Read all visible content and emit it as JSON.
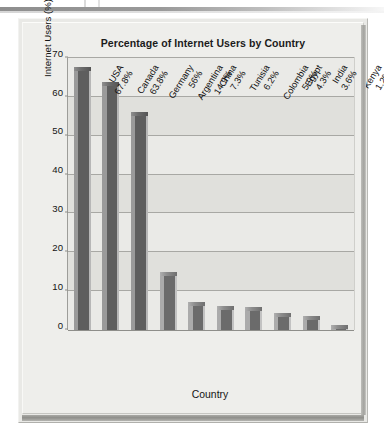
{
  "page": {
    "background_color": "#ffffff",
    "card_background": "#eeeeeb"
  },
  "chart_data": {
    "type": "bar",
    "title": "Percentage of Internet Users by Country",
    "xlabel": "Country",
    "ylabel": "Internet Users (%)",
    "ylim": [
      0,
      70
    ],
    "ytick_step": 10,
    "yticks": [
      0,
      10,
      20,
      30,
      40,
      50,
      60,
      70
    ],
    "grid": true,
    "legend": "none",
    "bar_color": "#5e5e5e",
    "bar_highlight_color": "#9a9a9a",
    "bar_shadow_color": "#b7b7b7",
    "categories": [
      "USA",
      "Canada",
      "Germany",
      "Argentina",
      "China",
      "Tunisia",
      "Colombia",
      "Egypt",
      "India",
      "Kenya"
    ],
    "values": [
      67.8,
      63.8,
      56,
      14.9,
      7.3,
      6.2,
      5.9,
      4.3,
      3.6,
      1.2
    ],
    "value_labels": [
      "67.8%",
      "63.8%",
      "56%",
      "14.9%",
      "7.3%",
      "6.2%",
      "5.9%",
      "4.3%",
      "3.6%",
      "1.2%"
    ],
    "tick_labels": [
      {
        "country": "USA",
        "pct": "67.8%"
      },
      {
        "country": "Canada",
        "pct": "63.8%"
      },
      {
        "country": "Germany",
        "pct": "56%"
      },
      {
        "country": "Argentina",
        "pct": "14.9%"
      },
      {
        "country": "China",
        "pct": "7.3%"
      },
      {
        "country": "Tunisia",
        "pct": "6.2%"
      },
      {
        "country": "Colombia",
        "pct": "5.9%"
      },
      {
        "country": "Egypt",
        "pct": "4.3%"
      },
      {
        "country": "India",
        "pct": "3.6%"
      },
      {
        "country": "Kenya",
        "pct": "1.2%"
      }
    ]
  }
}
